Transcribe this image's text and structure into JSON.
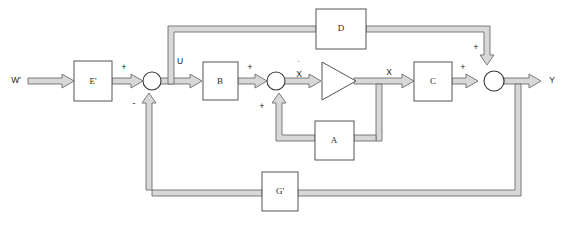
{
  "diagram": {
    "colors": {
      "background": "#ffffff",
      "wire_fill": "#d8d8d8",
      "wire_stroke": "#6e6e6e",
      "block_stroke": "#555555",
      "text": "#1a1a1a"
    },
    "blocks": [
      {
        "id": "E",
        "label": "E'",
        "shape": "rect"
      },
      {
        "id": "B",
        "label": "B",
        "shape": "rect"
      },
      {
        "id": "A",
        "label": "A",
        "shape": "rect"
      },
      {
        "id": "C",
        "label": "C",
        "shape": "rect"
      },
      {
        "id": "D",
        "label": "D",
        "shape": "rect"
      },
      {
        "id": "G",
        "label": "G'",
        "shape": "rect"
      },
      {
        "id": "INT",
        "label": "",
        "shape": "triangle"
      }
    ],
    "summing_junctions": [
      {
        "id": "sum1",
        "signs": [
          "+",
          "-"
        ]
      },
      {
        "id": "sum2",
        "signs": [
          "+",
          "+"
        ]
      },
      {
        "id": "sum3",
        "signs": [
          "+",
          "+"
        ]
      }
    ],
    "signals": {
      "input": "W'",
      "control": "U",
      "state_derivative": "X",
      "state_derivative_dot": "˙",
      "state": "X",
      "output": "Y"
    },
    "signs": {
      "e_to_sum1": "+",
      "g_to_sum1": "-",
      "b_to_sum2": "+",
      "a_to_sum2": "+",
      "c_to_sum3": "+",
      "d_to_sum3": "+"
    }
  }
}
